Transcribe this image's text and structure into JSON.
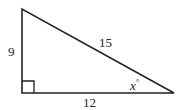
{
  "diagram": {
    "type": "right-triangle",
    "labels": {
      "vertical_leg": "9",
      "hypotenuse": "15",
      "horizontal_leg": "12",
      "angle": "x",
      "angle_unit": "°"
    },
    "right_angle_marker": true,
    "stroke_color": "#222222"
  }
}
